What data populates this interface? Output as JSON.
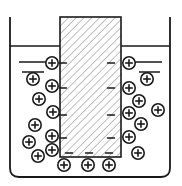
{
  "figure": {
    "background_color": "#ffffff",
    "stroke_color": "#1a1a1a",
    "hatch_color": "#8a8a8a",
    "width": 182,
    "height": 186
  },
  "container": {
    "label": "beaker",
    "left": 10,
    "right": 170,
    "top": 17,
    "bottom": 177,
    "corner_radius": 9,
    "stroke_width": 1.8
  },
  "liquid_surface": {
    "label": "liquid-surface-line",
    "y": 46,
    "x_start": 10,
    "x_end": 170,
    "stroke_width": 1.6
  },
  "block": {
    "label": "hatched-block",
    "left": 60,
    "right": 121,
    "top": 17,
    "bottom": 157,
    "fill": "#ffffff",
    "hatch_spacing": 5.5,
    "hatch_angle_deg": 45,
    "stroke_width": 1.6
  },
  "level_lines": [
    {
      "name": "left-upper-level-line",
      "x1": 19,
      "y1": 62,
      "x2": 49,
      "y2": 62
    },
    {
      "name": "left-lower-level-line",
      "x1": 22,
      "y1": 72,
      "x2": 44,
      "y2": 72
    },
    {
      "name": "right-upper-level-line",
      "x1": 131,
      "y1": 62,
      "x2": 162,
      "y2": 62
    },
    {
      "name": "right-lower-level-line",
      "x1": 139,
      "y1": 72,
      "x2": 160,
      "y2": 72
    }
  ],
  "negative_charges": {
    "symbol": "−",
    "length": 7,
    "stroke_width": 1.5,
    "left_edge": [
      {
        "x": 63,
        "y": 63
      },
      {
        "x": 63,
        "y": 88
      },
      {
        "x": 63,
        "y": 115
      },
      {
        "x": 63,
        "y": 138
      }
    ],
    "right_edge": [
      {
        "x": 111,
        "y": 63
      },
      {
        "x": 111,
        "y": 88
      },
      {
        "x": 111,
        "y": 115
      },
      {
        "x": 111,
        "y": 138
      }
    ],
    "bottom_edge": [
      {
        "x": 69,
        "y": 153
      },
      {
        "x": 89,
        "y": 153
      },
      {
        "x": 109,
        "y": 153
      }
    ]
  },
  "positive_charges": {
    "symbol": "⊕",
    "radius": 6.2,
    "stroke_width": 1.6,
    "left_group": [
      {
        "x": 52,
        "y": 63
      },
      {
        "x": 33,
        "y": 79
      },
      {
        "x": 52,
        "y": 86
      },
      {
        "x": 39,
        "y": 99
      },
      {
        "x": 53,
        "y": 112
      },
      {
        "x": 35,
        "y": 125
      },
      {
        "x": 52,
        "y": 136
      },
      {
        "x": 29,
        "y": 142
      },
      {
        "x": 38,
        "y": 156
      },
      {
        "x": 52,
        "y": 150
      }
    ],
    "right_group": [
      {
        "x": 129,
        "y": 63
      },
      {
        "x": 147,
        "y": 79
      },
      {
        "x": 129,
        "y": 88
      },
      {
        "x": 139,
        "y": 101
      },
      {
        "x": 129,
        "y": 113
      },
      {
        "x": 158,
        "y": 110
      },
      {
        "x": 141,
        "y": 124
      },
      {
        "x": 129,
        "y": 137
      },
      {
        "x": 138,
        "y": 153
      }
    ],
    "bottom_group": [
      {
        "x": 64,
        "y": 165
      },
      {
        "x": 88,
        "y": 165
      },
      {
        "x": 109,
        "y": 165
      }
    ]
  }
}
